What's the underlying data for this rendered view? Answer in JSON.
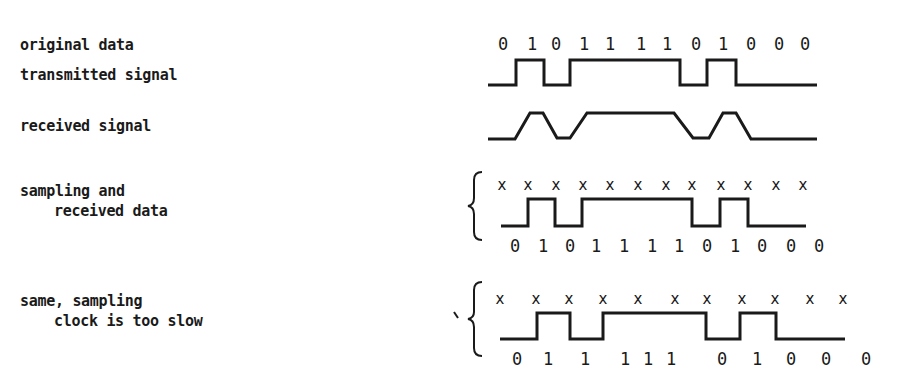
{
  "labels": {
    "original_data": "original data",
    "transmitted_signal": "transmitted signal",
    "received_signal": "received signal",
    "sampling_line1": "sampling and",
    "sampling_line2": "received data",
    "slow_line1": "same, sampling",
    "slow_line2": "clock is too slow"
  },
  "original_bits": [
    "0",
    "1",
    "0",
    "1",
    "1",
    "1",
    "1",
    "0",
    "1",
    "0",
    "0",
    "0"
  ],
  "sampling": {
    "sample_mark": "x",
    "received_bits": [
      "0",
      "1",
      "0",
      "1",
      "1",
      "1",
      "1",
      "0",
      "1",
      "0",
      "0",
      "0"
    ]
  },
  "slow_sampling": {
    "sample_mark": "x",
    "received_bits": [
      "0",
      "1",
      "1",
      "1",
      "1",
      "1",
      "0",
      "1",
      "0",
      "0",
      "0"
    ]
  },
  "colors": {
    "ink": "#1a1a1a",
    "background": "#ffffff"
  }
}
